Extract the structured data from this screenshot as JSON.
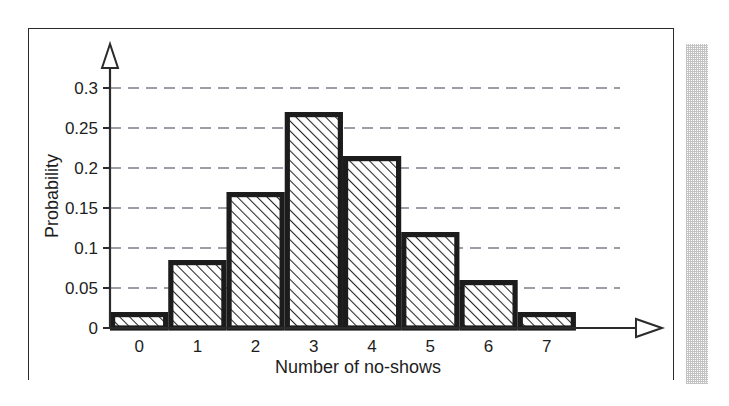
{
  "figure": {
    "frame_border_color": "#2a2a2a",
    "background_color": "#ffffff",
    "shadow_color": "#b9b9b9"
  },
  "chart_data": {
    "type": "bar",
    "title": "",
    "subtitle": "",
    "xlabel": "Number of no-shows",
    "ylabel": "Probability",
    "categories": [
      "0",
      "1",
      "2",
      "3",
      "4",
      "5",
      "6",
      "7"
    ],
    "values": [
      0.02,
      0.085,
      0.17,
      0.27,
      0.215,
      0.12,
      0.06,
      0.02
    ],
    "ylim": [
      0,
      0.33
    ],
    "yticks": [
      0,
      0.05,
      0.1,
      0.15,
      0.2,
      0.25,
      0.3
    ],
    "ytick_labels": [
      "0",
      "0.05",
      "0.1",
      "0.15",
      "0.2",
      "0.25",
      "0.3"
    ],
    "xlim": [
      -0.5,
      8.6
    ],
    "grid": "horizontal-dashed",
    "legend": "none",
    "bar_fill": "diagonal-hatch",
    "bar_edge_color": "#1c1c1c",
    "gridline_color": "#7d7d8a",
    "axis_color": "#2b2b2b",
    "annotations": []
  }
}
